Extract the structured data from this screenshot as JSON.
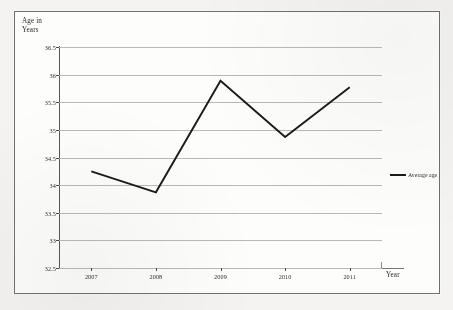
{
  "chart_data": {
    "type": "line",
    "title": "",
    "xlabel": "Year",
    "ylabel": "Age in\nYears",
    "categories": [
      "2007",
      "2008",
      "2009",
      "2010",
      "2011"
    ],
    "series": [
      {
        "name": "Average age",
        "values": [
          34.25,
          33.87,
          35.89,
          34.87,
          35.77
        ]
      }
    ],
    "ylim": [
      32.5,
      36.5
    ],
    "ytick_labels": [
      "36.5",
      "36",
      "35.5",
      "35",
      "34.5",
      "34",
      "33.5",
      "33",
      "32.5"
    ],
    "ytick_values": [
      36.5,
      36,
      35.5,
      35,
      34.5,
      34,
      33.5,
      33,
      32.5
    ],
    "grid": true,
    "grid_axis": "y",
    "legend_position": "right",
    "line_color": "#1b1b1b",
    "grid_color": "#b9b9b9",
    "axis_color": "#575757"
  },
  "legend": {
    "entries": [
      {
        "label": "Average age",
        "marker": "line-segment",
        "color": "#1b1b1b"
      }
    ]
  },
  "axes": {
    "y_title": "Age in\nYears",
    "x_title": "Year"
  }
}
